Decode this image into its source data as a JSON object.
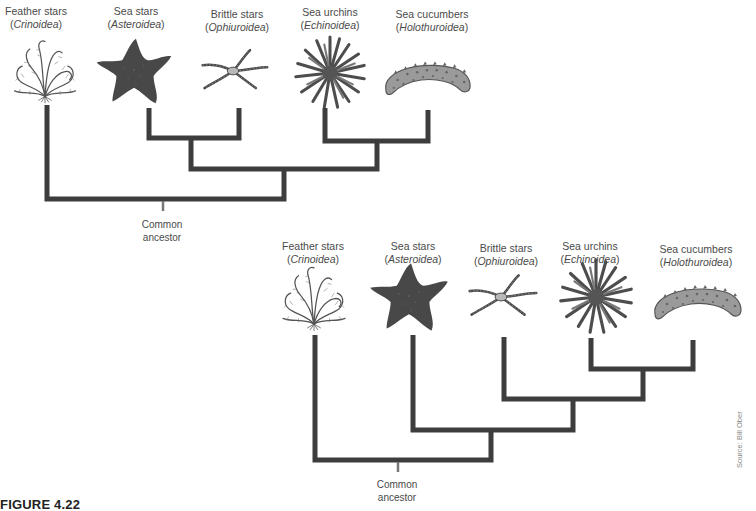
{
  "figure": {
    "caption_label": "FIGURE 4.22",
    "caption_rest": "Alternative...",
    "source": "Source: Bill Ober",
    "line_color": "#3d3d3d",
    "ancestor_stub_color": "#777777"
  },
  "trees": [
    {
      "id": "top-tree",
      "taxa": [
        {
          "common": "Feather stars",
          "scientific": "Crinoidea",
          "icon": "feather-star-icon"
        },
        {
          "common": "Sea stars",
          "scientific": "Asteroidea",
          "icon": "sea-star-icon"
        },
        {
          "common": "Brittle stars",
          "scientific": "Ophiuroidea",
          "icon": "brittle-star-icon"
        },
        {
          "common": "Sea urchins",
          "scientific": "Echinoidea",
          "icon": "sea-urchin-icon"
        },
        {
          "common": "Sea cucumbers",
          "scientific": "Holothuroidea",
          "icon": "sea-cucumber-icon"
        }
      ],
      "topology": "(Feather stars, ((Sea stars, Brittle stars), (Sea urchins, Sea cucumbers)))",
      "root_label_line1": "Common",
      "root_label_line2": "ancestor"
    },
    {
      "id": "bottom-tree",
      "taxa": [
        {
          "common": "Feather stars",
          "scientific": "Crinoidea",
          "icon": "feather-star-icon"
        },
        {
          "common": "Sea stars",
          "scientific": "Asteroidea",
          "icon": "sea-star-icon"
        },
        {
          "common": "Brittle stars",
          "scientific": "Ophiuroidea",
          "icon": "brittle-star-icon"
        },
        {
          "common": "Sea urchins",
          "scientific": "Echinoidea",
          "icon": "sea-urchin-icon"
        },
        {
          "common": "Sea cucumbers",
          "scientific": "Holothuroidea",
          "icon": "sea-cucumber-icon"
        }
      ],
      "topology": "(Feather stars, (Sea stars, (Brittle stars, (Sea urchins, Sea cucumbers))))",
      "root_label_line1": "Common",
      "root_label_line2": "ancestor"
    }
  ]
}
